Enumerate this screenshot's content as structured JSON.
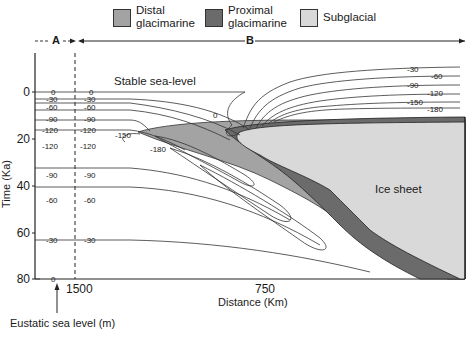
{
  "legend": [
    {
      "label_line1": "Distal",
      "label_line2": "glacimarine",
      "color": "#a3a3a3"
    },
    {
      "label_line1": "Proximal",
      "label_line2": "glacimarine",
      "color": "#6b6b6b"
    },
    {
      "label_line1": "Subglacial",
      "label_line2": "",
      "color": "#d9d9d9"
    }
  ],
  "zones": {
    "a": "A",
    "b": "B"
  },
  "annotations": {
    "stable_sea_level": "Stable sea-level",
    "ice_sheet": "Ice sheet",
    "eustatic": "Eustatic sea level (m)"
  },
  "axes": {
    "ylabel": "Time (Ka)",
    "xlabel": "Distance (Km)",
    "yticks": [
      "0",
      "20",
      "40",
      "60",
      "80"
    ],
    "xticks": [
      "1500",
      "750"
    ]
  },
  "contours": {
    "left_column": [
      "0",
      "-30",
      "-60",
      "-90",
      "-120",
      "-120",
      "-90",
      "-60",
      "-30",
      "0"
    ],
    "mid_column": [
      "0",
      "-30",
      "-60",
      "-90",
      "-120",
      "-120",
      "-90",
      "-60",
      "-30"
    ],
    "inner": [
      "-150",
      "-180",
      "0"
    ],
    "right_column": [
      "-30",
      "-60",
      "-90",
      "-120",
      "-150",
      "-180"
    ]
  }
}
